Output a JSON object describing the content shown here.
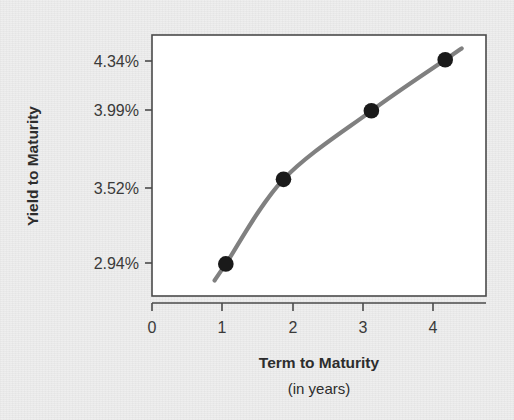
{
  "chart_data": {
    "type": "line",
    "title": "",
    "xlabel": "Term to Maturity",
    "xlabel_sub": "(in years)",
    "ylabel": "Yield to Maturity",
    "x": [
      1.05,
      1.87,
      3.12,
      4.17
    ],
    "values": [
      2.94,
      3.52,
      3.99,
      4.34
    ],
    "point_labels": [
      "2.94%",
      "3.52%",
      "3.99%",
      "4.34%"
    ],
    "xticks": [
      0,
      1,
      2,
      3,
      4
    ],
    "xtick_labels": [
      "0",
      "1",
      "2",
      "3",
      "4"
    ],
    "yticks": [
      2.94,
      3.52,
      3.99,
      4.34
    ],
    "ytick_labels": [
      "2.94%",
      "3.99%",
      "3.52%",
      "4.34%"
    ],
    "ytick_labels_ordered": [
      "4.34%",
      "3.99%",
      "3.52%",
      "2.94%"
    ],
    "xlim": [
      0,
      4.75
    ],
    "ylim": [
      2.72,
      4.51
    ],
    "grid": false,
    "legend": false,
    "series_name": "Yield curve",
    "line_color": "#808080",
    "marker_color": "#1a1a1a",
    "marker_shape": "circle",
    "plot_background": "#ffffff",
    "page_background": "#ededed",
    "text_color": "#2d2d2d",
    "tick_text_color": "#3a3a3a"
  },
  "axes": {
    "y_tick_0": "4.34%",
    "y_tick_1": "3.99%",
    "y_tick_2": "3.52%",
    "y_tick_3": "2.94%",
    "x_tick_0": "0",
    "x_tick_1": "1",
    "x_tick_2": "2",
    "x_tick_3": "3",
    "x_tick_4": "4",
    "y_title": "Yield to Maturity",
    "x_title": "Term to Maturity",
    "x_subtitle": "(in years)"
  }
}
